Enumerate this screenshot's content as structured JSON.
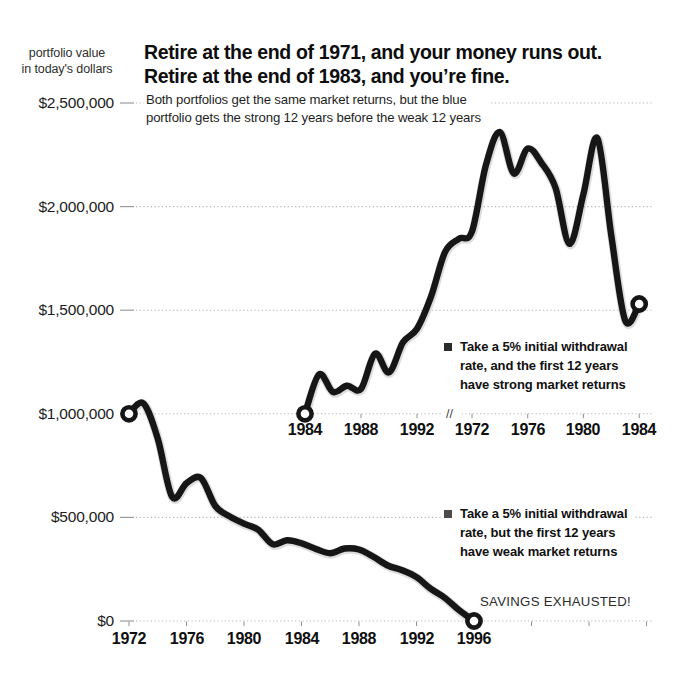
{
  "header": {
    "unit_label_line1": "portfolio value",
    "unit_label_line2": "in today's dollars",
    "title_line1": "Retire at the end of 1971, and your money runs out.",
    "title_line2": "Retire at the end of 1983, and you’re fine.",
    "subtitle_line1": "Both portfolios get the same market returns, but the blue",
    "subtitle_line2": "portfolio gets the strong 12 years before the weak 12 years"
  },
  "annotations": {
    "savings_exhausted": "SAVINGS EXHAUSTED!",
    "legend_strong": {
      "bullet_color": "#2b2b2b",
      "lines": [
        "Take a 5% initial withdrawal",
        "rate, and the first 12 years",
        "have strong market returns"
      ]
    },
    "legend_weak": {
      "bullet_color": "#4a4a4a",
      "lines": [
        "Take a 5% initial withdrawal",
        "rate, but the first 12 years",
        "have weak market returns"
      ]
    }
  },
  "chart_data": {
    "type": "line",
    "ylabel": "portfolio value in today's dollars",
    "grid": true,
    "ylim": [
      0,
      2500000
    ],
    "y_axis": {
      "values": [
        2500000,
        2000000,
        1500000,
        1000000,
        500000,
        0
      ],
      "labels": [
        "$2,500,000",
        "$2,000,000",
        "$1,500,000",
        "$1,000,000",
        "$500,000",
        "$0"
      ]
    },
    "x_axis_bottom": {
      "label_years": [
        1972,
        1976,
        1980,
        1984,
        1988,
        1992,
        1996
      ],
      "labels": [
        "1972",
        "1976",
        "1980",
        "1984",
        "1988",
        "1992",
        "1996"
      ],
      "extra_tick_years": [
        2000,
        2004,
        2008
      ]
    },
    "x_axis_middle": {
      "segment_a_label_years": [
        1984,
        1988,
        1992
      ],
      "segment_a_labels": [
        "1984",
        "1988",
        "1992"
      ],
      "break_label": "//",
      "segment_b_label_years": [
        1972,
        1976,
        1980,
        1984
      ],
      "segment_b_labels": [
        "1972",
        "1976",
        "1980",
        "1984"
      ]
    },
    "series": [
      {
        "name": "Take a 5% initial withdrawal rate, and the first 12 years have strong market returns",
        "color": "#161616",
        "axis": "middle",
        "segments": [
          {
            "axis_segment": "A",
            "points": [
              [
                1984,
                1000000
              ],
              [
                1985,
                1190000
              ],
              [
                1986,
                1105000
              ],
              [
                1987,
                1135000
              ],
              [
                1988,
                1120000
              ],
              [
                1989,
                1290000
              ],
              [
                1990,
                1200000
              ],
              [
                1991,
                1345000
              ],
              [
                1992,
                1410000
              ],
              [
                1993,
                1565000
              ],
              [
                1994,
                1780000
              ],
              [
                1995,
                1845000
              ]
            ]
          },
          {
            "axis_segment": "B",
            "points": [
              [
                1972,
                1880000
              ],
              [
                1973,
                2200000
              ],
              [
                1974,
                2360000
              ],
              [
                1975,
                2160000
              ],
              [
                1976,
                2280000
              ],
              [
                1977,
                2210000
              ],
              [
                1978,
                2090000
              ],
              [
                1979,
                1820000
              ],
              [
                1980,
                2060000
              ],
              [
                1981,
                2330000
              ],
              [
                1982,
                1860000
              ],
              [
                1983,
                1450000
              ],
              [
                1984,
                1530000
              ]
            ]
          }
        ]
      },
      {
        "name": "Take a 5% initial withdrawal rate, but the first 12 years have weak market returns",
        "color": "#161616",
        "axis": "bottom",
        "points": [
          [
            1972,
            1000000
          ],
          [
            1973,
            1050000
          ],
          [
            1974,
            880000
          ],
          [
            1975,
            600000
          ],
          [
            1976,
            665000
          ],
          [
            1977,
            690000
          ],
          [
            1978,
            555000
          ],
          [
            1979,
            505000
          ],
          [
            1980,
            470000
          ],
          [
            1981,
            440000
          ],
          [
            1982,
            370000
          ],
          [
            1983,
            390000
          ],
          [
            1984,
            375000
          ],
          [
            1985,
            348000
          ],
          [
            1986,
            327000
          ],
          [
            1987,
            350000
          ],
          [
            1988,
            345000
          ],
          [
            1989,
            310000
          ],
          [
            1990,
            268000
          ],
          [
            1991,
            245000
          ],
          [
            1992,
            212000
          ],
          [
            1993,
            155000
          ],
          [
            1994,
            110000
          ],
          [
            1995,
            50000
          ],
          [
            1996,
            0
          ]
        ]
      }
    ]
  }
}
